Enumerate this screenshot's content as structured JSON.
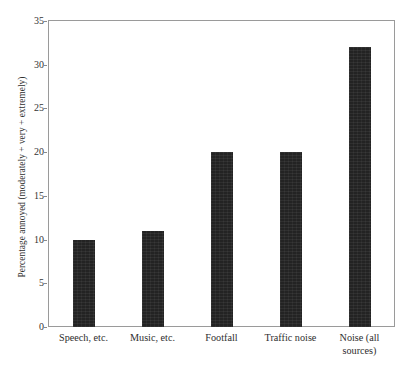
{
  "chart_data": {
    "type": "bar",
    "title": "",
    "subtitle": "",
    "xlabel": "",
    "ylabel": "Percentage annoyed (moderately + very + extremely)",
    "categories": [
      "Speech, etc.",
      "Music, etc.",
      "Footfall",
      "Traffic noise",
      "Noise (all sources)"
    ],
    "category_lines": [
      [
        "Speech, etc."
      ],
      [
        "Music, etc."
      ],
      [
        "Footfall"
      ],
      [
        "Traffic noise"
      ],
      [
        "Noise (all",
        "sources)"
      ]
    ],
    "values": [
      10,
      11,
      20,
      20,
      32
    ],
    "ylim": [
      0,
      35
    ],
    "yticks": [
      0,
      5,
      10,
      15,
      20,
      25,
      30,
      35
    ],
    "ytick_labels": [
      "0",
      "5",
      "10",
      "15",
      "20",
      "25",
      "30",
      "35"
    ],
    "grid": false,
    "legend": null,
    "bar_color": "#232323",
    "frame_color": "#9a9a9a",
    "background_color": "#ffffff",
    "annotations": []
  }
}
